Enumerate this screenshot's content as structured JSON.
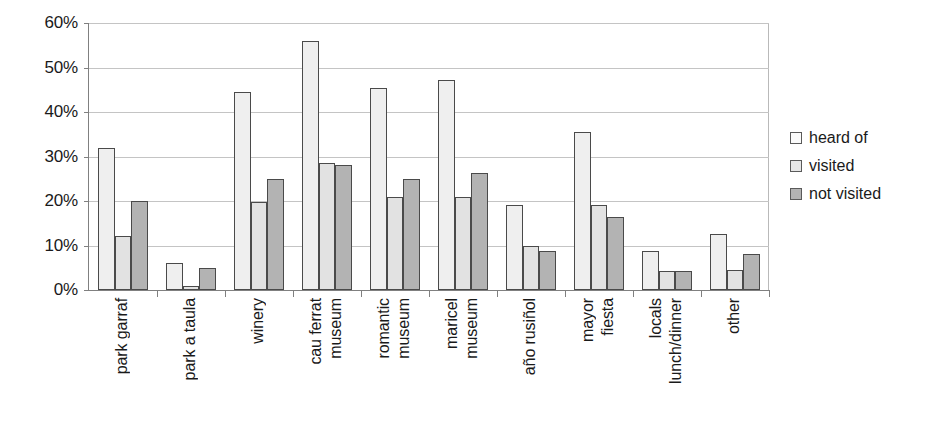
{
  "chart_data": {
    "type": "bar",
    "title": "",
    "subtitle": "",
    "xlabel": "",
    "ylabel": "",
    "ylim": [
      0,
      60
    ],
    "ytick_values": [
      0,
      10,
      20,
      30,
      40,
      50,
      60
    ],
    "ytick_labels": [
      "0%",
      "10%",
      "20%",
      "30%",
      "40%",
      "50%",
      "60%"
    ],
    "grid": true,
    "legend_position": "right",
    "categories": [
      "park garraf",
      "park a taula",
      "winery",
      "museum cau ferrat",
      "museum romantic",
      "museum maricel",
      "año rusiñol",
      "fiesta mayor",
      "lunch/dinner locals",
      "other"
    ],
    "category_label_lines": [
      [
        "park garraf"
      ],
      [
        "park a taula"
      ],
      [
        "winery"
      ],
      [
        "museum",
        "cau ferrat"
      ],
      [
        "museum",
        "romantic"
      ],
      [
        "museum",
        "maricel"
      ],
      [
        "año rusiñol"
      ],
      [
        "fiesta",
        "mayor"
      ],
      [
        "lunch/dinner",
        "locals"
      ],
      [
        "other"
      ]
    ],
    "series": [
      {
        "name": "heard of",
        "color": "#efefef",
        "values": [
          32.0,
          6.0,
          44.5,
          56.0,
          45.5,
          47.2,
          19.2,
          35.5,
          8.8,
          12.7
        ]
      },
      {
        "name": "visited",
        "color": "#e2e2e2",
        "values": [
          12.2,
          0.8,
          19.7,
          28.5,
          21.0,
          21.0,
          10.0,
          19.0,
          4.2,
          4.5
        ]
      },
      {
        "name": "not visited",
        "color": "#b3b3b3",
        "values": [
          20.0,
          5.0,
          25.0,
          28.0,
          25.0,
          26.4,
          8.8,
          16.3,
          4.2,
          8.0
        ]
      }
    ]
  },
  "legend": {
    "items": [
      {
        "label": "heard of"
      },
      {
        "label": "visited"
      },
      {
        "label": "not visited"
      }
    ]
  }
}
